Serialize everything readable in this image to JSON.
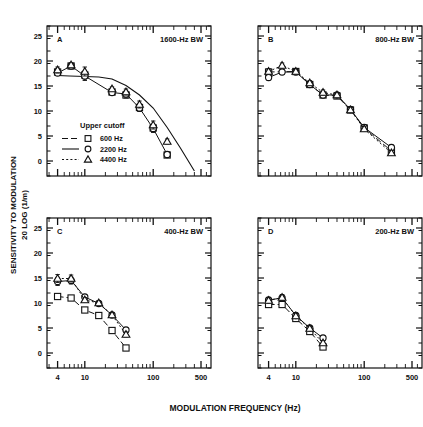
{
  "figure": {
    "xlabel": "MODULATION FREQUENCY (Hz)",
    "ylabel_line1": "SENSITIVITY TO MODULATION",
    "ylabel_line2": "20 LOG (1/m)",
    "line_color": "#111111",
    "background": "#ffffff"
  },
  "legend": {
    "title": "Upper cutoff",
    "items": [
      {
        "label": "600 Hz",
        "marker": "square",
        "dash": "long-dash"
      },
      {
        "label": "2200 Hz",
        "marker": "circle",
        "dash": "solid"
      },
      {
        "label": "4400 Hz",
        "marker": "triangle",
        "dash": "short-dash"
      }
    ]
  },
  "axes": {
    "x_ticks": [
      "4",
      "10",
      "100",
      "500"
    ],
    "x_tick_values": [
      4,
      10,
      100,
      500
    ],
    "x_min": 2.8,
    "x_max": 700,
    "y_ticks": [
      "0",
      "5",
      "10",
      "15",
      "20",
      "25"
    ],
    "y_tick_values": [
      0,
      5,
      10,
      15,
      20,
      25
    ],
    "y_min": -3,
    "y_max": 27
  },
  "chart_data": {
    "type": "line",
    "xlabel": "MODULATION FREQUENCY (Hz)",
    "ylabel": "SENSITIVITY TO MODULATION 20 LOG (1/m)",
    "xscale": "log",
    "xlim": [
      2.8,
      700
    ],
    "ylim": [
      -3,
      27
    ],
    "grid": false,
    "legend_position": "inside-lower-left-panel-A",
    "panels": [
      {
        "id": "A",
        "label": "A",
        "annotation": "1600-Hz BW",
        "series": [
          {
            "name": "600 Hz",
            "marker": "square",
            "dash": "long-dash",
            "connected": false,
            "x": [
              4,
              6.3,
              10,
              25,
              40,
              63,
              100,
              160,
              250,
              400
            ],
            "values": [
              17.8,
              19.0,
              17.2,
              13.8,
              13.2,
              10.7,
              6.6,
              1.2,
              null,
              null
            ],
            "errors": [
              0.6,
              0.4,
              0.8,
              0.4,
              0.6,
              0.7,
              0.7,
              0.5,
              null,
              null
            ]
          },
          {
            "name": "2200 Hz",
            "marker": "circle",
            "dash": "solid",
            "connected": true,
            "x": [
              4,
              6.3,
              10,
              25,
              40,
              63,
              100,
              160,
              250,
              400
            ],
            "values": [
              17.6,
              19.0,
              17.0,
              13.7,
              13.4,
              10.6,
              6.5,
              1.3,
              null,
              null
            ],
            "errors": [
              0.5,
              0.4,
              0.9,
              0.4,
              0.6,
              0.7,
              0.8,
              0.5,
              null,
              null
            ]
          },
          {
            "name": "4400 Hz",
            "marker": "triangle",
            "dash": "short-dash",
            "connected": false,
            "x": [
              4,
              6.3,
              10,
              25,
              40,
              63,
              100,
              160,
              250,
              400
            ],
            "values": [
              18.2,
              19.2,
              17.9,
              14.4,
              13.8,
              11.3,
              7.2,
              3.9,
              null,
              null
            ],
            "errors": [
              0.6,
              0.4,
              0.9,
              0.4,
              0.6,
              0.7,
              0.8,
              0.5,
              null,
              null
            ]
          }
        ],
        "fitted_curve": {
          "x": [
            4,
            6,
            10,
            16,
            25,
            40,
            63,
            100,
            160,
            250,
            400
          ],
          "y": [
            17.1,
            17.0,
            16.9,
            16.8,
            16.4,
            15.1,
            13.2,
            10.6,
            6.7,
            2.6,
            -2.0
          ]
        }
      },
      {
        "id": "B",
        "label": "B",
        "annotation": "800-Hz BW",
        "series": [
          {
            "name": "600 Hz",
            "marker": "square",
            "dash": "long-dash",
            "connected": true,
            "x": [
              4,
              6.3,
              10,
              16,
              25,
              40,
              63,
              100,
              250
            ],
            "values": [
              17.8,
              null,
              17.9,
              15.3,
              13.2,
              13.0,
              10.2,
              6.6,
              2.0
            ],
            "errors": [
              0.6,
              null,
              0.5,
              0.5,
              0.5,
              0.5,
              0.5,
              0.5,
              0.5
            ]
          },
          {
            "name": "2200 Hz",
            "marker": "circle",
            "dash": "solid",
            "connected": true,
            "x": [
              4,
              6.3,
              10,
              16,
              25,
              40,
              63,
              100,
              250
            ],
            "values": [
              16.7,
              17.8,
              17.8,
              15.3,
              13.2,
              13.2,
              10.3,
              6.7,
              2.7
            ],
            "errors": [
              0.5,
              0.5,
              0.5,
              0.5,
              0.5,
              0.5,
              0.5,
              0.5,
              0.5
            ]
          },
          {
            "name": "4400 Hz",
            "marker": "triangle",
            "dash": "short-dash",
            "connected": true,
            "x": [
              4,
              6.3,
              10,
              16,
              25,
              40,
              63,
              100,
              250
            ],
            "values": [
              17.9,
              19.1,
              17.9,
              15.6,
              13.7,
              13.2,
              10.2,
              6.4,
              1.6
            ],
            "errors": [
              0.5,
              0.5,
              0.5,
              0.5,
              0.5,
              0.5,
              0.5,
              0.5,
              0.5
            ]
          }
        ]
      },
      {
        "id": "C",
        "label": "C",
        "annotation": "400-Hz BW",
        "series": [
          {
            "name": "600 Hz",
            "marker": "square",
            "dash": "long-dash",
            "connected": true,
            "x": [
              4,
              6.3,
              10,
              16,
              25,
              40,
              63,
              100
            ],
            "values": [
              11.3,
              11.0,
              8.6,
              7.5,
              4.5,
              1.0,
              null,
              null
            ],
            "errors": [
              0.4,
              0.4,
              0.4,
              0.4,
              0.4,
              0.4,
              null,
              null
            ]
          },
          {
            "name": "2200 Hz",
            "marker": "circle",
            "dash": "solid",
            "connected": true,
            "x": [
              4,
              6.3,
              10,
              16,
              25,
              40,
              63,
              100
            ],
            "values": [
              14.3,
              14.5,
              11.2,
              9.9,
              7.6,
              4.6,
              null,
              null
            ],
            "errors": [
              0.8,
              0.7,
              0.5,
              0.4,
              0.5,
              0.5,
              null,
              null
            ]
          },
          {
            "name": "4400 Hz",
            "marker": "triangle",
            "dash": "short-dash",
            "connected": true,
            "x": [
              4,
              6.3,
              10,
              16,
              25,
              40,
              63,
              100
            ],
            "values": [
              14.9,
              14.9,
              10.6,
              10.0,
              7.6,
              3.7,
              null,
              null
            ],
            "errors": [
              0.8,
              0.7,
              0.5,
              0.4,
              0.5,
              0.5,
              null,
              null
            ]
          }
        ]
      },
      {
        "id": "D",
        "label": "D",
        "annotation": "200-Hz BW",
        "series": [
          {
            "name": "600 Hz",
            "marker": "square",
            "dash": "long-dash",
            "connected": true,
            "x": [
              4,
              6.3,
              10,
              16,
              25
            ],
            "values": [
              9.7,
              9.7,
              6.9,
              4.3,
              1.2
            ],
            "errors": [
              0.4,
              0.4,
              0.5,
              0.4,
              0.4
            ]
          },
          {
            "name": "2200 Hz",
            "marker": "circle",
            "dash": "solid",
            "connected": true,
            "x": [
              4,
              6.3,
              10,
              16,
              25
            ],
            "values": [
              10.6,
              11.0,
              7.5,
              5.0,
              3.0
            ],
            "errors": [
              0.5,
              0.6,
              0.5,
              0.4,
              0.4
            ]
          },
          {
            "name": "4400 Hz",
            "marker": "triangle",
            "dash": "short-dash",
            "connected": true,
            "x": [
              4,
              6.3,
              10,
              16,
              25
            ],
            "values": [
              10.5,
              11.1,
              7.4,
              4.9,
              2.0
            ],
            "errors": [
              0.5,
              0.6,
              0.5,
              0.4,
              0.4
            ]
          }
        ]
      }
    ]
  }
}
